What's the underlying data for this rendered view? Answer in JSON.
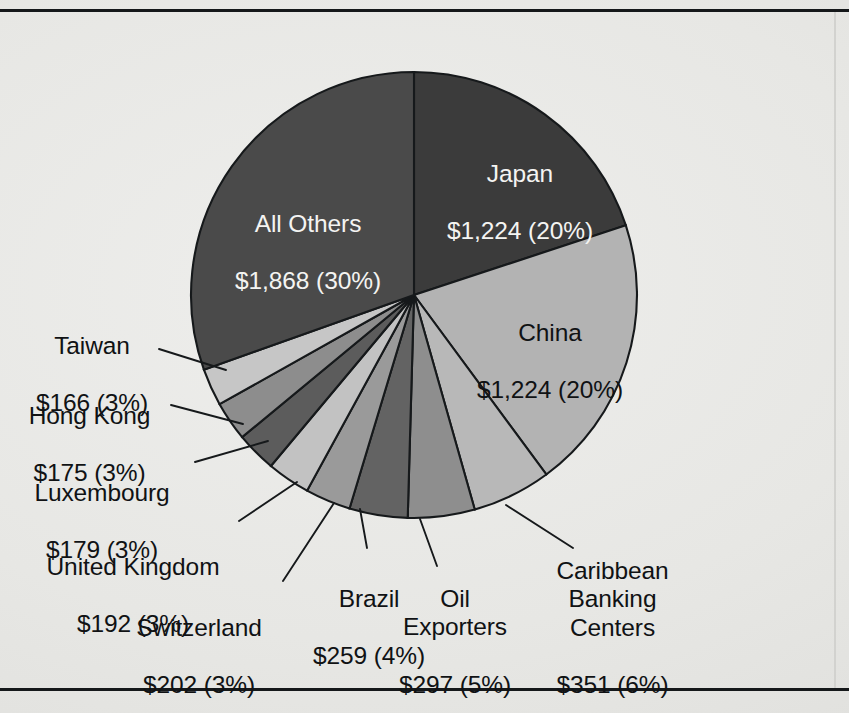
{
  "figure": {
    "background_color": "#e7e7e4",
    "rule_color": "#15181a",
    "has_top_rule": true,
    "has_bottom_rule": true
  },
  "chart_data": {
    "type": "pie",
    "title": "",
    "subtitle": "",
    "xlabel": "",
    "ylabel": "",
    "legend_position": "none",
    "grid": false,
    "value_prefix": "$",
    "start_angle_deg": 0,
    "direction": "clockwise",
    "total_value": 6137,
    "categories": [
      "Japan",
      "China",
      "Caribbean Banking Centers",
      "Oil Exporters",
      "Brazil",
      "Switzerland",
      "United Kingdom",
      "Luxembourg",
      "Hong Kong",
      "Taiwan",
      "All Others"
    ],
    "values": [
      1224,
      1224,
      351,
      297,
      259,
      202,
      192,
      179,
      175,
      166,
      1868
    ],
    "percents": [
      20,
      20,
      6,
      5,
      4,
      3,
      3,
      3,
      3,
      3,
      30
    ],
    "slices": [
      {
        "name": "Japan",
        "label": "Japan",
        "value": 1224,
        "value_text": "$1,224",
        "percent": 20,
        "percent_text": "(20%)",
        "color": "#3b3b3b",
        "label_color": "#f4f4f2",
        "label_placement": "inside"
      },
      {
        "name": "China",
        "label": "China",
        "value": 1224,
        "value_text": "$1,224",
        "percent": 20,
        "percent_text": "(20%)",
        "color": "#b3b3b3",
        "label_color": "#101214",
        "label_placement": "inside"
      },
      {
        "name": "Caribbean Banking Centers",
        "label": "Caribbean\nBanking\nCenters",
        "value": 351,
        "value_text": "$351",
        "percent": 6,
        "percent_text": "(6%)",
        "color": "#b8b8b8",
        "label_color": "#101214",
        "label_placement": "outside"
      },
      {
        "name": "Oil Exporters",
        "label": "Oil\nExporters",
        "value": 297,
        "value_text": "$297",
        "percent": 5,
        "percent_text": "(5%)",
        "color": "#8e8e8e",
        "label_color": "#101214",
        "label_placement": "outside"
      },
      {
        "name": "Brazil",
        "label": "Brazil",
        "value": 259,
        "value_text": "$259",
        "percent": 4,
        "percent_text": "(4%)",
        "color": "#636363",
        "label_color": "#101214",
        "label_placement": "outside"
      },
      {
        "name": "Switzerland",
        "label": "Switzerland",
        "value": 202,
        "value_text": "$202",
        "percent": 3,
        "percent_text": "(3%)",
        "color": "#9a9a9a",
        "label_color": "#101214",
        "label_placement": "outside"
      },
      {
        "name": "United Kingdom",
        "label": "United Kingdom",
        "value": 192,
        "value_text": "$192",
        "percent": 3,
        "percent_text": "(3%)",
        "color": "#c2c2c2",
        "label_color": "#101214",
        "label_placement": "outside"
      },
      {
        "name": "Luxembourg",
        "label": "Luxembourg",
        "value": 179,
        "value_text": "$179",
        "percent": 3,
        "percent_text": "(3%)",
        "color": "#5c5c5c",
        "label_color": "#101214",
        "label_placement": "outside"
      },
      {
        "name": "Hong Kong",
        "label": "Hong Kong",
        "value": 175,
        "value_text": "$175",
        "percent": 3,
        "percent_text": "(3%)",
        "color": "#8d8d8d",
        "label_color": "#101214",
        "label_placement": "outside"
      },
      {
        "name": "Taiwan",
        "label": "Taiwan",
        "value": 166,
        "value_text": "$166",
        "percent": 3,
        "percent_text": "(3%)",
        "color": "#c6c6c6",
        "label_color": "#101214",
        "label_placement": "outside"
      },
      {
        "name": "All Others",
        "label": "All Others",
        "value": 1868,
        "value_text": "$1,868",
        "percent": 30,
        "percent_text": "(30%)",
        "color": "#4a4a4a",
        "label_color": "#f4f4f2",
        "label_placement": "inside"
      }
    ]
  },
  "labels": {
    "japan": {
      "name": "Japan",
      "amount": "$1,224 (20%)"
    },
    "china": {
      "name": "China",
      "amount": "$1,224 (20%)"
    },
    "all_others": {
      "name": "All Others",
      "amount": "$1,868 (30%)"
    },
    "taiwan": {
      "name": "Taiwan",
      "amount": "$166 (3%)"
    },
    "hong_kong": {
      "name": "Hong Kong",
      "amount": "$175 (3%)"
    },
    "luxembourg": {
      "name": "Luxembourg",
      "amount": "$179 (3%)"
    },
    "united_kingdom": {
      "name": "United Kingdom",
      "amount": "$192 (3%)"
    },
    "switzerland": {
      "name": "Switzerland",
      "amount": "$202 (3%)"
    },
    "brazil": {
      "name": "Brazil",
      "amount": "$259 (4%)"
    },
    "oil_exporters": {
      "name": "Oil\nExporters",
      "amount": "$297 (5%)"
    },
    "caribbean": {
      "name": "Caribbean\nBanking\nCenters",
      "amount": "$351 (6%)"
    }
  }
}
